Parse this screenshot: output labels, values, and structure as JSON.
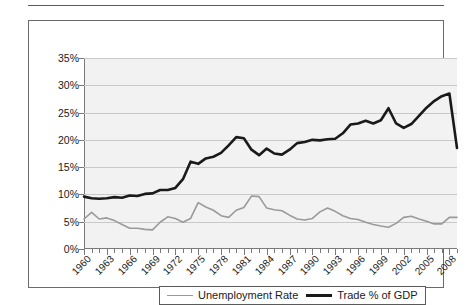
{
  "chart_data": {
    "type": "line",
    "title": "",
    "xlabel": "",
    "ylabel": "",
    "ylim": [
      0,
      35
    ],
    "xlim": [
      1960,
      2009
    ],
    "grid": true,
    "legend_position": "bottom",
    "y_ticks": [
      "0%",
      "5%",
      "10%",
      "15%",
      "20%",
      "25%",
      "30%",
      "35%"
    ],
    "y_tick_values": [
      0,
      5,
      10,
      15,
      20,
      25,
      30,
      35
    ],
    "x_tick_labels": [
      "1960",
      "1963",
      "1966",
      "1969",
      "1972",
      "1975",
      "1978",
      "1981",
      "1984",
      "1987",
      "1990",
      "1993",
      "1996",
      "1999",
      "2002",
      "2005",
      "2008"
    ],
    "x_tick_values": [
      1960,
      1963,
      1966,
      1969,
      1972,
      1975,
      1978,
      1981,
      1984,
      1987,
      1990,
      1993,
      1996,
      1999,
      2002,
      2005,
      2008
    ],
    "x": [
      1960,
      1961,
      1962,
      1963,
      1964,
      1965,
      1966,
      1967,
      1968,
      1969,
      1970,
      1971,
      1972,
      1973,
      1974,
      1975,
      1976,
      1977,
      1978,
      1979,
      1980,
      1981,
      1982,
      1983,
      1984,
      1985,
      1986,
      1987,
      1988,
      1989,
      1990,
      1991,
      1992,
      1993,
      1994,
      1995,
      1996,
      1997,
      1998,
      1999,
      2000,
      2001,
      2002,
      2003,
      2004,
      2005,
      2006,
      2007,
      2008,
      2009
    ],
    "series": [
      {
        "name": "Unemployment Rate",
        "color": "#9a9a9a",
        "width": 1.6,
        "values": [
          5.5,
          6.7,
          5.5,
          5.7,
          5.2,
          4.5,
          3.8,
          3.8,
          3.6,
          3.5,
          4.9,
          5.9,
          5.6,
          4.9,
          5.6,
          8.5,
          7.7,
          7.1,
          6.1,
          5.8,
          7.1,
          7.6,
          9.7,
          9.6,
          7.5,
          7.2,
          7.0,
          6.2,
          5.5,
          5.3,
          5.6,
          6.8,
          7.5,
          6.9,
          6.1,
          5.6,
          5.4,
          4.9,
          4.5,
          4.2,
          4.0,
          4.7,
          5.8,
          6.0,
          5.5,
          5.1,
          4.6,
          4.6,
          5.8,
          5.8
        ]
      },
      {
        "name": "Trade % of GDP",
        "color": "#1a1a1a",
        "width": 2.6,
        "values": [
          9.6,
          9.3,
          9.2,
          9.3,
          9.5,
          9.4,
          9.8,
          9.7,
          10.1,
          10.2,
          10.8,
          10.8,
          11.2,
          12.8,
          16.0,
          15.6,
          16.6,
          16.9,
          17.6,
          19.0,
          20.5,
          20.3,
          18.2,
          17.2,
          18.4,
          17.5,
          17.3,
          18.2,
          19.4,
          19.6,
          20.0,
          19.9,
          20.1,
          20.2,
          21.2,
          22.8,
          23.0,
          23.5,
          23.0,
          23.6,
          25.8,
          23.0,
          22.2,
          22.9,
          24.4,
          25.9,
          27.1,
          28.0,
          28.5,
          18.5
        ]
      }
    ]
  },
  "legend": {
    "items": [
      {
        "label": "Unemployment Rate",
        "swatch": "thin-gray-line"
      },
      {
        "label": "Trade % of GDP",
        "swatch": "thick-black-line"
      }
    ]
  },
  "colors": {
    "plot_background": "#f2f2f2",
    "gridline": "#c9c9c9",
    "axis": "#7a7a7a",
    "frame": "#6a6a6a",
    "unemployment": "#9a9a9a",
    "trade": "#1a1a1a"
  }
}
